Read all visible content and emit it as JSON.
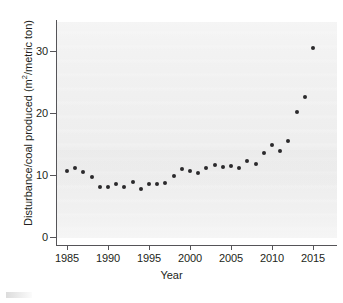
{
  "chart_data": {
    "type": "scatter",
    "title": "",
    "xlabel": "Year",
    "ylabel": "Disturbance/coal produced (m2/metric ton)",
    "ylabel_parts": {
      "before": "Disturbance/coal produced (m",
      "superscript": "2",
      "after": "/metric ton)"
    },
    "xlim": [
      1983.5,
      2016.5
    ],
    "ylim": [
      -1.5,
      34
    ],
    "xticks": [
      1985,
      1990,
      1995,
      2000,
      2005,
      2010,
      2015
    ],
    "xtick_labels": [
      "1985",
      "1990",
      "1995",
      "2000",
      "2005",
      "2010",
      "2015"
    ],
    "yticks": [
      0,
      10,
      20,
      30
    ],
    "ytick_labels": [
      "0",
      "10",
      "20",
      "30"
    ],
    "grid": false,
    "legend": null,
    "marker": {
      "shape": "circle",
      "color": "#2b2a2c",
      "size": 4
    },
    "x": [
      1985,
      1986,
      1987,
      1988,
      1989,
      1990,
      1991,
      1992,
      1993,
      1994,
      1995,
      1996,
      1997,
      1998,
      1999,
      2000,
      2001,
      2002,
      2003,
      2004,
      2005,
      2006,
      2007,
      2008,
      2009,
      2010,
      2011,
      2012,
      2013,
      2014,
      2015
    ],
    "y": [
      10.7,
      11.1,
      10.5,
      9.7,
      8.0,
      8.1,
      8.5,
      8.0,
      8.9,
      7.7,
      8.5,
      8.6,
      8.7,
      9.9,
      11.0,
      10.7,
      10.3,
      11.2,
      11.6,
      11.3,
      11.4,
      11.1,
      12.2,
      11.8,
      13.6,
      14.9,
      13.8,
      15.5,
      20.1,
      22.6,
      30.5
    ],
    "points": [
      {
        "year": 1985,
        "value": 10.7
      },
      {
        "year": 1986,
        "value": 11.1
      },
      {
        "year": 1987,
        "value": 10.5
      },
      {
        "year": 1988,
        "value": 9.7
      },
      {
        "year": 1989,
        "value": 8.0
      },
      {
        "year": 1990,
        "value": 8.1
      },
      {
        "year": 1991,
        "value": 8.5
      },
      {
        "year": 1992,
        "value": 8.0
      },
      {
        "year": 1993,
        "value": 8.9
      },
      {
        "year": 1994,
        "value": 7.7
      },
      {
        "year": 1995,
        "value": 8.5
      },
      {
        "year": 1996,
        "value": 8.6
      },
      {
        "year": 1997,
        "value": 8.7
      },
      {
        "year": 1998,
        "value": 9.9
      },
      {
        "year": 1999,
        "value": 11.0
      },
      {
        "year": 2000,
        "value": 10.7
      },
      {
        "year": 2001,
        "value": 10.3
      },
      {
        "year": 2002,
        "value": 11.2
      },
      {
        "year": 2003,
        "value": 11.6
      },
      {
        "year": 2004,
        "value": 11.3
      },
      {
        "year": 2005,
        "value": 11.4
      },
      {
        "year": 2006,
        "value": 11.1
      },
      {
        "year": 2007,
        "value": 12.2
      },
      {
        "year": 2008,
        "value": 11.8
      },
      {
        "year": 2009,
        "value": 13.6
      },
      {
        "year": 2010,
        "value": 14.9
      },
      {
        "year": 2011,
        "value": 13.8
      },
      {
        "year": 2012,
        "value": 15.5
      },
      {
        "year": 2013,
        "value": 20.1
      },
      {
        "year": 2014,
        "value": 22.6
      },
      {
        "year": 2015,
        "value": 30.5
      }
    ]
  }
}
